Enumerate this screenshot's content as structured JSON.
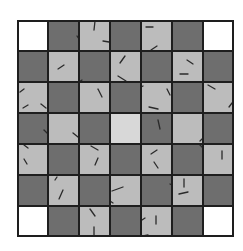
{
  "board": {
    "rows": 7,
    "cols": 7,
    "cell_size": 31,
    "colors": {
      "white": "#ffffff",
      "dark": "#6e6e6e",
      "light": "#bcbcbc",
      "center": "#d8d8d8",
      "grid_line": "#1e1e1e",
      "tick": "#2a2a2a"
    },
    "cells": [
      [
        "white",
        "dark",
        "light",
        "dark",
        "light",
        "dark",
        "white"
      ],
      [
        "dark",
        "light",
        "dark",
        "light",
        "dark",
        "light",
        "dark"
      ],
      [
        "light",
        "dark",
        "light",
        "dark",
        "light",
        "dark",
        "light"
      ],
      [
        "dark",
        "light",
        "dark",
        "center",
        "dark",
        "light",
        "dark"
      ],
      [
        "light",
        "dark",
        "light",
        "dark",
        "light",
        "dark",
        "light"
      ],
      [
        "dark",
        "light",
        "dark",
        "light",
        "dark",
        "light",
        "dark"
      ],
      [
        "white",
        "dark",
        "light",
        "dark",
        "light",
        "dark",
        "white"
      ]
    ],
    "ticks": [
      {
        "r": 0,
        "c": 2,
        "x1": 16,
        "y1": 1,
        "x2": 15,
        "y2": 10
      },
      {
        "r": 0,
        "c": 2,
        "x1": 24,
        "y1": 21,
        "x2": 30,
        "y2": 22
      },
      {
        "r": 0,
        "c": 1,
        "x1": 29,
        "y1": 16,
        "x2": 31,
        "y2": 19
      },
      {
        "r": 0,
        "c": 4,
        "x1": 5,
        "y1": 7,
        "x2": 12,
        "y2": 7
      },
      {
        "r": 0,
        "c": 4,
        "x1": 10,
        "y1": 30,
        "x2": 16,
        "y2": 26
      },
      {
        "r": 1,
        "c": 1,
        "x1": 10,
        "y1": 18,
        "x2": 16,
        "y2": 14
      },
      {
        "r": 1,
        "c": 3,
        "x1": 15,
        "y1": 5,
        "x2": 10,
        "y2": 12
      },
      {
        "r": 1,
        "c": 3,
        "x1": 8,
        "y1": 25,
        "x2": 16,
        "y2": 30
      },
      {
        "r": 1,
        "c": 5,
        "x1": 15,
        "y1": 9,
        "x2": 21,
        "y2": 13
      },
      {
        "r": 1,
        "c": 5,
        "x1": 8,
        "y1": 23,
        "x2": 16,
        "y2": 23
      },
      {
        "r": 1,
        "c": 2,
        "x1": 0,
        "y1": 31,
        "x2": 3,
        "y2": 29
      },
      {
        "r": 2,
        "c": 0,
        "x1": 7,
        "y1": 7,
        "x2": 3,
        "y2": 10
      },
      {
        "r": 2,
        "c": 0,
        "x1": 6,
        "y1": 26,
        "x2": 11,
        "y2": 23
      },
      {
        "r": 2,
        "c": 0,
        "x1": 24,
        "y1": 22,
        "x2": 29,
        "y2": 26
      },
      {
        "r": 2,
        "c": 2,
        "x1": 19,
        "y1": 7,
        "x2": 23,
        "y2": 15
      },
      {
        "r": 2,
        "c": 4,
        "x1": 0,
        "y1": 5,
        "x2": 2,
        "y2": 4
      },
      {
        "r": 2,
        "c": 4,
        "x1": 26,
        "y1": 7,
        "x2": 29,
        "y2": 13
      },
      {
        "r": 2,
        "c": 4,
        "x1": 8,
        "y1": 25,
        "x2": 17,
        "y2": 27
      },
      {
        "r": 2,
        "c": 6,
        "x1": 5,
        "y1": 3,
        "x2": 12,
        "y2": 7
      },
      {
        "r": 2,
        "c": 6,
        "x1": 26,
        "y1": 25,
        "x2": 29,
        "y2": 21
      },
      {
        "r": 3,
        "c": 1,
        "x1": 25,
        "y1": 20,
        "x2": 30,
        "y2": 24
      },
      {
        "r": 3,
        "c": 0,
        "x1": 27,
        "y1": 17,
        "x2": 30,
        "y2": 20
      },
      {
        "r": 3,
        "c": 4,
        "x1": 17,
        "y1": 7,
        "x2": 19,
        "y2": 16
      },
      {
        "r": 3,
        "c": 5,
        "x1": 30,
        "y1": 26,
        "x2": 28,
        "y2": 28
      },
      {
        "r": 4,
        "c": 0,
        "x1": 7,
        "y1": 1,
        "x2": 11,
        "y2": 4
      },
      {
        "r": 4,
        "c": 0,
        "x1": 7,
        "y1": 15,
        "x2": 10,
        "y2": 20
      },
      {
        "r": 4,
        "c": 2,
        "x1": 12,
        "y1": 2,
        "x2": 19,
        "y2": 6
      },
      {
        "r": 4,
        "c": 2,
        "x1": 19,
        "y1": 14,
        "x2": 16,
        "y2": 21
      },
      {
        "r": 4,
        "c": 4,
        "x1": 10,
        "y1": 10,
        "x2": 16,
        "y2": 6
      },
      {
        "r": 4,
        "c": 4,
        "x1": 13,
        "y1": 18,
        "x2": 17,
        "y2": 24
      },
      {
        "r": 4,
        "c": 6,
        "x1": 19,
        "y1": 7,
        "x2": 19,
        "y2": 15
      },
      {
        "r": 4,
        "c": 5,
        "x1": 27,
        "y1": 0,
        "x2": 30,
        "y2": 3
      },
      {
        "r": 5,
        "c": 1,
        "x1": 9,
        "y1": 2,
        "x2": 7,
        "y2": 5
      },
      {
        "r": 5,
        "c": 1,
        "x1": 15,
        "y1": 15,
        "x2": 11,
        "y2": 24
      },
      {
        "r": 5,
        "c": 3,
        "x1": 2,
        "y1": 16,
        "x2": 13,
        "y2": 12
      },
      {
        "r": 5,
        "c": 3,
        "x1": 0,
        "y1": 26,
        "x2": 3,
        "y2": 28
      },
      {
        "r": 5,
        "c": 5,
        "x1": 12,
        "y1": 4,
        "x2": 12,
        "y2": 12
      },
      {
        "r": 5,
        "c": 5,
        "x1": 7,
        "y1": 19,
        "x2": 16,
        "y2": 17
      },
      {
        "r": 5,
        "c": 4,
        "x1": 29,
        "y1": 9,
        "x2": 31,
        "y2": 10
      },
      {
        "r": 6,
        "c": 2,
        "x1": 11,
        "y1": 3,
        "x2": 16,
        "y2": 10
      },
      {
        "r": 6,
        "c": 2,
        "x1": 15,
        "y1": 21,
        "x2": 15,
        "y2": 30
      },
      {
        "r": 6,
        "c": 4,
        "x1": 1,
        "y1": 14,
        "x2": 4,
        "y2": 12
      },
      {
        "r": 6,
        "c": 4,
        "x1": 15,
        "y1": 10,
        "x2": 15,
        "y2": 18
      },
      {
        "r": 6,
        "c": 4,
        "x1": 2,
        "y1": 30,
        "x2": 7,
        "y2": 29
      }
    ]
  }
}
